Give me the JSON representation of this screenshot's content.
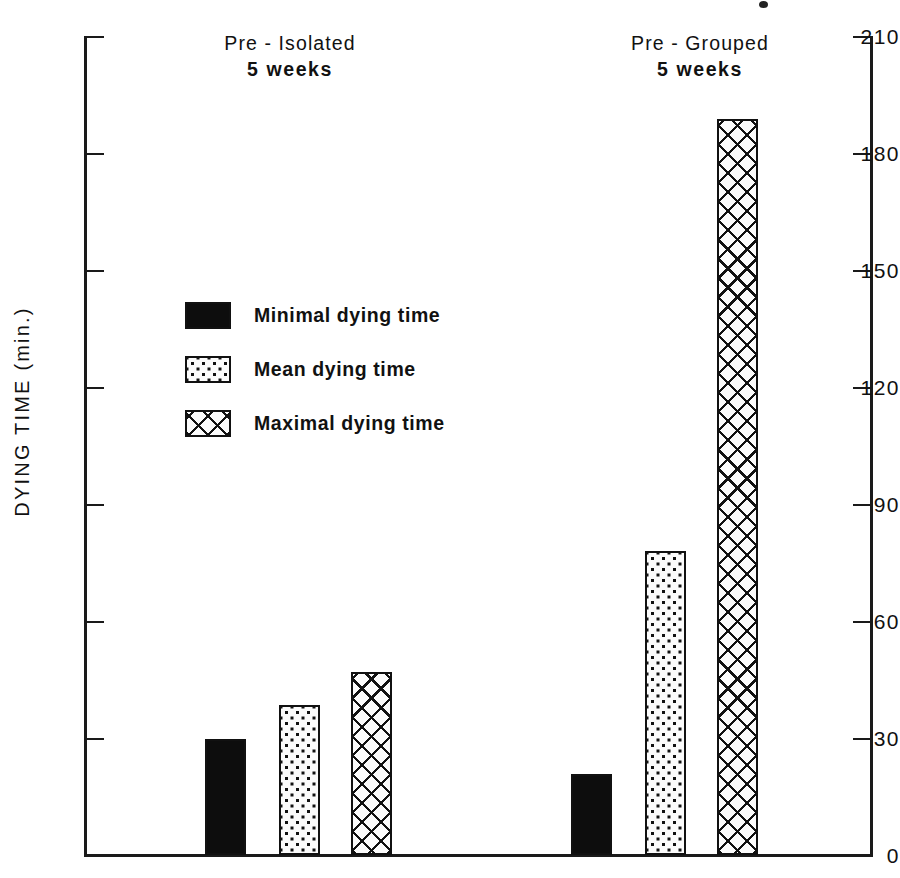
{
  "chart_data": {
    "type": "bar",
    "title": "",
    "xlabel": "",
    "ylabel": "DYING TIME  (min.)",
    "ylim": [
      0,
      210
    ],
    "ytick_step": 30,
    "yticks": [
      0,
      30,
      60,
      90,
      120,
      150,
      180,
      210
    ],
    "ytick_labels": [
      "0",
      "30",
      "60",
      "90",
      "120",
      "150",
      "180",
      "210"
    ],
    "grid": false,
    "legend_position": "upper-left-inside",
    "categories": [
      "Pre - Isolated\n5 weeks",
      "Pre - Grouped\n5 weeks"
    ],
    "series": [
      {
        "name": "Minimal dying time",
        "pattern": "solid",
        "values": [
          30,
          21
        ]
      },
      {
        "name": "Mean dying time",
        "pattern": "dotted",
        "values": [
          38.5,
          78
        ]
      },
      {
        "name": "Maximal dying time",
        "pattern": "crosshatch",
        "values": [
          47,
          189
        ]
      }
    ]
  },
  "axes": {
    "y_title": "DYING TIME  (min.)",
    "tick_labels": [
      "210",
      "180",
      "150",
      "120",
      "90",
      "60",
      "30",
      "0"
    ]
  },
  "groups": [
    {
      "line1": "Pre - Isolated",
      "line2": "5 weeks"
    },
    {
      "line1": "Pre - Grouped",
      "line2": "5 weeks"
    }
  ],
  "legend": {
    "items": [
      {
        "label": "Minimal dying time",
        "pattern": "solid"
      },
      {
        "label": "Mean dying time",
        "pattern": "dotted"
      },
      {
        "label": "Maximal dying time",
        "pattern": "crosshatch"
      }
    ]
  },
  "colors": {
    "ink": "#111111",
    "paper": "#ffffff",
    "fill_solid": "#0d0d0d",
    "fill_pattern_bg": "#fbfbfb"
  }
}
